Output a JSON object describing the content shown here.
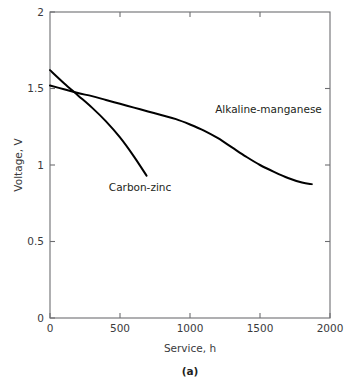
{
  "figure": {
    "caption": "(a)"
  },
  "chart_data": {
    "type": "line",
    "title": "",
    "subtitle": "",
    "xlabel": "Service, h",
    "ylabel": "Voltage, V",
    "xlim": [
      0,
      2000
    ],
    "ylim": [
      0,
      2
    ],
    "xticks": [
      0,
      500,
      1000,
      1500,
      2000
    ],
    "xtick_labels": [
      "0",
      "500",
      "1000",
      "1500",
      "2000"
    ],
    "yticks": [
      0,
      0.5,
      1,
      1.5,
      2
    ],
    "ytick_labels": [
      "0",
      "0.5",
      "1",
      "1.5",
      "2"
    ],
    "grid": false,
    "legend_position": "inline-annotation",
    "frame": "box-with-inward-ticks",
    "series": [
      {
        "name": "Alkaline-manganese",
        "label_x": 1180,
        "label_y": 1.34,
        "color": "#000000",
        "x": [
          0,
          100,
          200,
          300,
          400,
          500,
          600,
          700,
          800,
          900,
          1000,
          1100,
          1200,
          1300,
          1400,
          1500,
          1600,
          1700,
          1800,
          1870
        ],
        "y": [
          1.52,
          1.495,
          1.47,
          1.45,
          1.425,
          1.4,
          1.375,
          1.35,
          1.325,
          1.3,
          1.265,
          1.225,
          1.175,
          1.115,
          1.055,
          1.0,
          0.955,
          0.915,
          0.885,
          0.875
        ]
      },
      {
        "name": "Carbon-zinc",
        "label_x": 420,
        "label_y": 0.83,
        "color": "#000000",
        "x": [
          0,
          100,
          200,
          300,
          400,
          500,
          600,
          690
        ],
        "y": [
          1.62,
          1.535,
          1.455,
          1.375,
          1.285,
          1.18,
          1.055,
          0.93
        ]
      }
    ]
  }
}
